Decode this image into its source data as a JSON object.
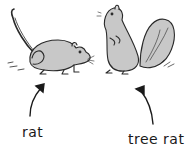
{
  "illustration": {
    "left_figure": {
      "subject": "rat",
      "label": "rat",
      "icon": "rat-drawing"
    },
    "right_figure": {
      "subject": "squirrel",
      "label": "tree rat",
      "icon": "squirrel-drawing"
    }
  },
  "colors": {
    "fur": "#c8c8c8",
    "outline": "#2a2a2a",
    "background": "#ffffff"
  }
}
